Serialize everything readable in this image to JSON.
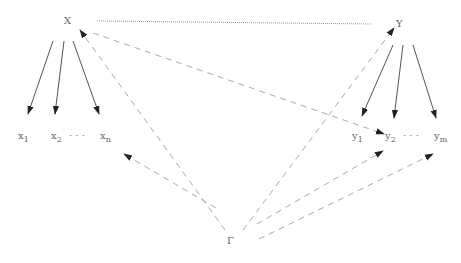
{
  "diagram": {
    "nodes": {
      "X": {
        "label": "X",
        "x": 67,
        "y": 22
      },
      "Y": {
        "label": "Y",
        "x": 399,
        "y": 24
      },
      "Gamma": {
        "label": "Γ",
        "x": 230,
        "y": 241
      }
    },
    "x_children": {
      "x1": {
        "base": "x",
        "sub": "1"
      },
      "x2": {
        "base": "x",
        "sub": "2"
      },
      "dots": "· · ·",
      "xn": {
        "base": "x",
        "sub": "n"
      }
    },
    "y_children": {
      "y1": {
        "base": "y",
        "sub": "1"
      },
      "y2": {
        "base": "y",
        "sub": "2"
      },
      "dots": "· · ·",
      "ym": {
        "base": "y",
        "sub": "m"
      }
    },
    "edges": [
      {
        "from": "X",
        "to": "Y",
        "style": "solid-thin"
      },
      {
        "from": "X",
        "to": "x1",
        "style": "solid-arrow"
      },
      {
        "from": "X",
        "to": "x2",
        "style": "solid-arrow"
      },
      {
        "from": "X",
        "to": "xn",
        "style": "solid-arrow"
      },
      {
        "from": "Y",
        "to": "y1",
        "style": "solid-arrow"
      },
      {
        "from": "Y",
        "to": "y2",
        "style": "solid-arrow"
      },
      {
        "from": "Y",
        "to": "ym",
        "style": "solid-arrow"
      },
      {
        "from": "X",
        "to": "y2",
        "style": "dashed-arrow"
      },
      {
        "from": "Gamma",
        "to": "X",
        "style": "dashed-arrow"
      },
      {
        "from": "Gamma",
        "to": "Y",
        "style": "dashed-arrow"
      },
      {
        "from": "Gamma",
        "to": "x-group",
        "style": "dashed-arrow"
      },
      {
        "from": "Gamma",
        "to": "y2",
        "style": "dashed-arrow"
      },
      {
        "from": "Gamma",
        "to": "ym",
        "style": "dashed-arrow"
      }
    ],
    "colors": {
      "solid": "#555555",
      "dashed": "#aaaaaa",
      "arrowhead": "#222222",
      "label": "#666666"
    }
  }
}
